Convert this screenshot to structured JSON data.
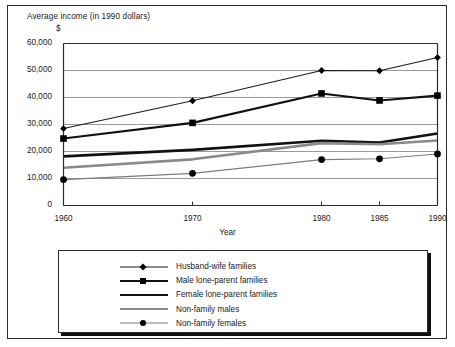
{
  "chart_data": {
    "type": "line",
    "title": "Average income (in 1990 dollars)",
    "currency_label": "$",
    "xlabel": "Year",
    "ylabel": "",
    "x": [
      1960,
      1970,
      1980,
      1985,
      1990
    ],
    "xtick_labels": [
      "1960",
      "1970",
      "1980",
      "1985",
      "1990"
    ],
    "ytick_labels": [
      "0",
      "10,000",
      "20,000",
      "30,000",
      "40,000",
      "50,000",
      "60,000"
    ],
    "ytick_values": [
      0,
      10000,
      20000,
      30000,
      40000,
      50000,
      60000
    ],
    "ylim": [
      0,
      60000
    ],
    "xlim": [
      1960,
      1990
    ],
    "grid": "horizontal",
    "legend_position": "below",
    "series": [
      {
        "name": "Husband-wife families",
        "values": [
          28500,
          38800,
          50000,
          49900,
          54800
        ],
        "color": "#1a1a1a",
        "line_width": 1.1,
        "marker": "diamond"
      },
      {
        "name": "Male lone-parent families",
        "values": [
          24800,
          30600,
          41500,
          38900,
          40700
        ],
        "color": "#111111",
        "line_width": 2.1,
        "marker": "square"
      },
      {
        "name": "Female lone-parent families",
        "values": [
          18200,
          20600,
          24000,
          23300,
          26700
        ],
        "color": "#111111",
        "line_width": 2.6,
        "marker": "none"
      },
      {
        "name": "Non-family males",
        "values": [
          14000,
          17100,
          23100,
          22700,
          24100
        ],
        "color": "#8a8a8a",
        "line_width": 2.6,
        "marker": "none"
      },
      {
        "name": "Non-family females",
        "values": [
          9600,
          11900,
          17000,
          17300,
          19100
        ],
        "color": "#7d7d7d",
        "line_width": 1.1,
        "marker": "circle"
      }
    ]
  },
  "legend": {
    "items": [
      {
        "label": "Husband-wife families"
      },
      {
        "label": "Male lone-parent families"
      },
      {
        "label": "Female lone-parent families"
      },
      {
        "label": "Non-family males"
      },
      {
        "label": "Non-family females"
      }
    ]
  },
  "colors": {
    "frame": "#2a2a2a",
    "gridline": "#9a9a9a",
    "axis": "#2a2a2a",
    "background": "#ffffff",
    "dark_series": "#111111",
    "gray_series": "#8a8a8a"
  }
}
